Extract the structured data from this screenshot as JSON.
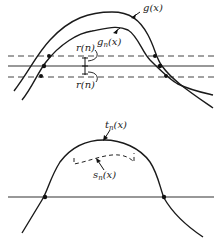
{
  "figure_top": {
    "labels": {
      "g": "g(x)",
      "gn_base": "g",
      "gn_sub": "n",
      "gn_arg": "(x)",
      "r_upper": "r(n)",
      "r_lower": "r(n)"
    }
  },
  "figure_bottom": {
    "labels": {
      "tn_base": "t",
      "tn_sub": "n",
      "tn_arg": "(x)",
      "sn_base": "s",
      "sn_sub": "n",
      "sn_arg": "(x)"
    }
  },
  "colors": {
    "ink": "#1a1a1a",
    "background": "#ffffff"
  }
}
